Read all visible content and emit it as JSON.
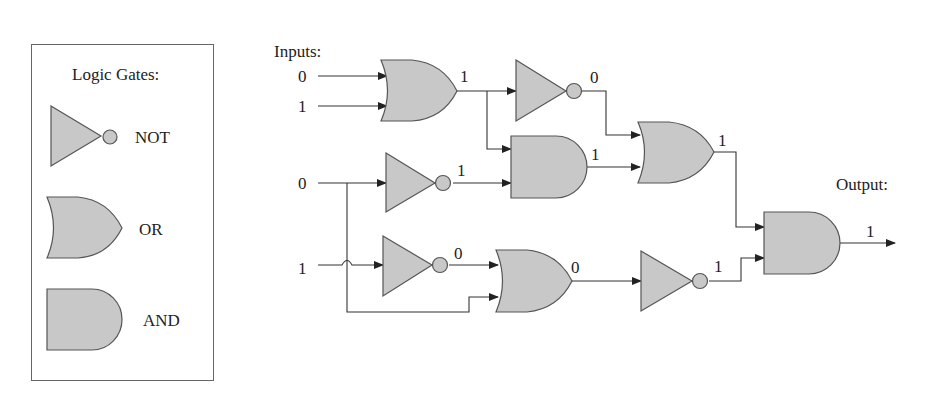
{
  "legend": {
    "title": "Logic Gates:",
    "items": [
      {
        "type": "NOT",
        "label": "NOT"
      },
      {
        "type": "OR",
        "label": "OR"
      },
      {
        "type": "AND",
        "label": "AND"
      }
    ]
  },
  "circuit": {
    "inputs_label": "Inputs:",
    "output_label": "Output:",
    "inputs": [
      "0",
      "1",
      "0",
      "1"
    ],
    "gates": [
      {
        "id": "or1",
        "type": "OR",
        "inputs": [
          "0",
          "1"
        ],
        "output": "1"
      },
      {
        "id": "not1",
        "type": "NOT",
        "input": "1",
        "output": "0"
      },
      {
        "id": "not2",
        "type": "NOT",
        "input": "0",
        "output": "1"
      },
      {
        "id": "and1",
        "type": "AND",
        "inputs": [
          "1",
          "1"
        ],
        "output": "1"
      },
      {
        "id": "or2",
        "type": "OR",
        "inputs": [
          "0",
          "1"
        ],
        "output": "1"
      },
      {
        "id": "not3",
        "type": "NOT",
        "input": "1",
        "output": "0"
      },
      {
        "id": "or3",
        "type": "OR",
        "inputs": [
          "0",
          "0"
        ],
        "output": "0"
      },
      {
        "id": "not4",
        "type": "NOT",
        "input": "0",
        "output": "1"
      },
      {
        "id": "and2",
        "type": "AND",
        "inputs": [
          "1",
          "1"
        ],
        "output": "1"
      }
    ],
    "final_output": "1"
  },
  "colors": {
    "gate_fill": "#c8c8c8",
    "gate_stroke": "#555555",
    "wire": "#333333"
  }
}
